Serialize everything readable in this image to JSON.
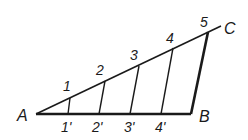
{
  "diagram": {
    "type": "geometric-construction",
    "points": {
      "A": {
        "label": "A",
        "x": 36,
        "y": 114
      },
      "B": {
        "label": "B",
        "x": 191,
        "y": 114
      },
      "C": {
        "label": "C",
        "x": 221,
        "y": 26
      }
    },
    "ray_divisions": [
      {
        "label": "1",
        "x": 70,
        "y": 98
      },
      {
        "label": "2",
        "x": 105,
        "y": 81
      },
      {
        "label": "3",
        "x": 139,
        "y": 66
      },
      {
        "label": "4",
        "x": 173,
        "y": 48
      },
      {
        "label": "5",
        "x": 208,
        "y": 32
      }
    ],
    "segment_divisions": [
      {
        "label": "1'",
        "x": 68,
        "y": 114
      },
      {
        "label": "2'",
        "x": 99,
        "y": 114
      },
      {
        "label": "3'",
        "x": 130,
        "y": 114
      },
      {
        "label": "4'",
        "x": 161,
        "y": 114
      }
    ],
    "colors": {
      "stroke": "#1a1a1a",
      "background": "#ffffff"
    }
  }
}
